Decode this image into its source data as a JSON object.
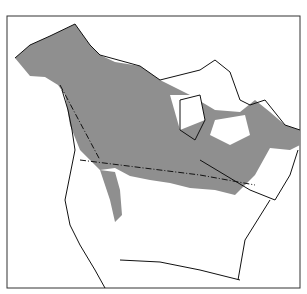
{
  "map": {
    "subject": "North America species range map",
    "colors": {
      "range": "#8f8f8f",
      "outline": "#111111",
      "background": "#ffffff",
      "frame": "#333333"
    },
    "legend": null
  }
}
